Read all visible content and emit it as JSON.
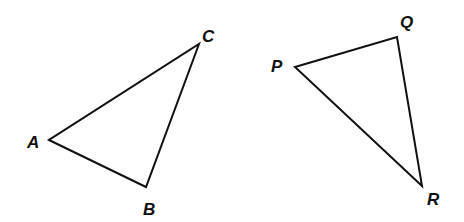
{
  "diagram": {
    "triangles": [
      {
        "name": "ABC",
        "vertices": [
          {
            "label": "A",
            "x": 49,
            "y": 140,
            "lx": 27,
            "ly": 148
          },
          {
            "label": "B",
            "x": 146,
            "y": 187,
            "lx": 143,
            "ly": 215
          },
          {
            "label": "C",
            "x": 199,
            "y": 44,
            "lx": 202,
            "ly": 42
          }
        ]
      },
      {
        "name": "PQR",
        "vertices": [
          {
            "label": "P",
            "x": 295,
            "y": 67,
            "lx": 271,
            "ly": 72
          },
          {
            "label": "Q",
            "x": 397,
            "y": 37,
            "lx": 400,
            "ly": 28
          },
          {
            "label": "R",
            "x": 422,
            "y": 186,
            "lx": 427,
            "ly": 205
          }
        ]
      }
    ],
    "stroke_color": "#111111",
    "background": "#ffffff"
  }
}
